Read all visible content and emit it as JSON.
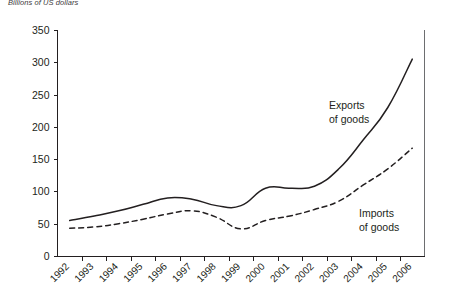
{
  "figure": {
    "unit_caption": "Billions of US dollars"
  },
  "chart_data": {
    "type": "line",
    "title": "",
    "subtitle": "",
    "xlabel": "",
    "ylabel": "Billions of US dollars",
    "categories": [
      "1992",
      "1993",
      "1994",
      "1995",
      "1996",
      "1997",
      "1998",
      "1999",
      "2000",
      "2001",
      "2002",
      "2003",
      "2004",
      "2005",
      "2006"
    ],
    "x": [
      1992,
      1993,
      1994,
      1995,
      1996,
      1997,
      1998,
      1999,
      2000,
      2001,
      2002,
      2003,
      2004,
      2005,
      2006
    ],
    "ylim": [
      0,
      350
    ],
    "yticks": [
      0,
      50,
      100,
      150,
      200,
      250,
      300,
      350
    ],
    "ytick_labels": [
      "0",
      "50",
      "100",
      "150",
      "200",
      "250",
      "300",
      "350"
    ],
    "xtick_labels": [
      "1992",
      "1993",
      "1994",
      "1995",
      "1996",
      "1997",
      "1998",
      "1999",
      "2000",
      "2001",
      "2002",
      "2003",
      "2004",
      "2005",
      "2006"
    ],
    "xtick_rotation": 45,
    "grid": false,
    "legend": "inline-annotations",
    "series": [
      {
        "name": "Exports of goods",
        "style": "solid",
        "color": "#231f20",
        "label_text_line1": "Exports",
        "label_text_line2": "of goods",
        "values": [
          55,
          62,
          70,
          80,
          90,
          88,
          78,
          78,
          105,
          105,
          108,
          135,
          180,
          230,
          305
        ]
      },
      {
        "name": "Imports of goods",
        "style": "dashed",
        "color": "#231f20",
        "label_text_line1": "Imports",
        "label_text_line2": "of goods",
        "values": [
          43,
          45,
          50,
          57,
          65,
          70,
          60,
          42,
          55,
          62,
          72,
          85,
          110,
          135,
          167
        ]
      }
    ],
    "annotations": [
      {
        "text": "Exports of goods",
        "x": 2003,
        "y": 205
      },
      {
        "text": "Imports of goods",
        "x": 2004,
        "y": 65
      }
    ]
  }
}
